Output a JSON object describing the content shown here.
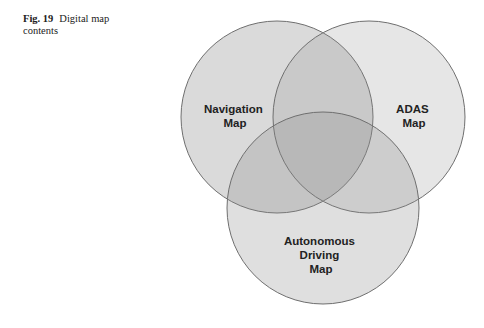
{
  "figure": {
    "number": "Fig. 19",
    "caption": "Digital map contents"
  },
  "diagram": {
    "type": "venn",
    "colors": {
      "fill": "#8c8c8c",
      "stroke": "#707070",
      "background": "#ffffff"
    },
    "sets": [
      {
        "id": "navigation",
        "lines": [
          "Navigation",
          "Map"
        ]
      },
      {
        "id": "adas",
        "lines": [
          "ADAS",
          "Map"
        ]
      },
      {
        "id": "autonomous",
        "lines": [
          "Autonomous",
          "Driving",
          "Map"
        ]
      }
    ]
  }
}
